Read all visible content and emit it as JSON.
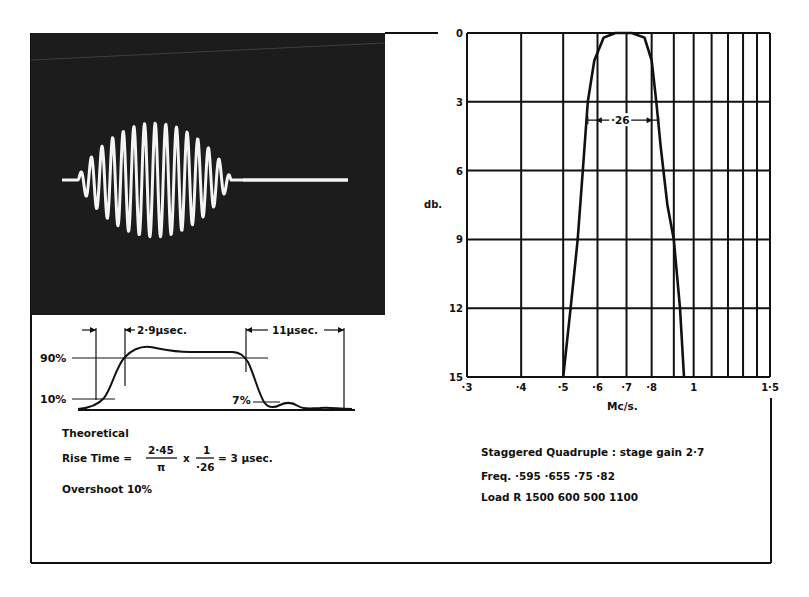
{
  "figure": {
    "photo": {
      "description": "oscilloscope trace of pulsed carrier burst",
      "background": "#1a1a1a",
      "trace_color": "#f4f4f4"
    },
    "pulse_diagram": {
      "label_90": "90%",
      "label_10": "10%",
      "label_7": "7%",
      "rise_label": "2·9µsec.",
      "decay_label": "11µsec."
    },
    "theory": {
      "heading": "Theoretical",
      "rise_prefix": "Rise Time =",
      "num1": "2·45",
      "den1": "π",
      "times": "x",
      "num2": "1",
      "den2": "·26",
      "result": "= 3 µsec.",
      "overshoot": "Overshoot  10%"
    },
    "notes": {
      "line1": "Staggered Quadruple : stage gain 2·7",
      "line2": "Freq.  ·595  ·655  ·75  ·82",
      "line3": "Load R 1500 600 500 1100"
    }
  },
  "chart_data": {
    "type": "line",
    "title": "",
    "xlabel": "Mc/s.",
    "ylabel": "db.",
    "x_scale": "log",
    "xlim": [
      0.3,
      1.5
    ],
    "ylim": [
      0,
      15
    ],
    "y_inverted": true,
    "grid": true,
    "x_ticks": [
      "·3",
      "·4",
      "·5",
      "·6",
      "·7",
      "·8",
      "1",
      "1·5"
    ],
    "x_grid_values": [
      0.3,
      0.4,
      0.5,
      0.6,
      0.7,
      0.8,
      0.9,
      1.0,
      1.1,
      1.2,
      1.3,
      1.4,
      1.5
    ],
    "y_ticks": [
      "0",
      "3",
      "6",
      "9",
      "12",
      "15"
    ],
    "y_tick_values": [
      0,
      3,
      6,
      9,
      12,
      15
    ],
    "annotations": [
      {
        "text": "·26",
        "type": "bandwidth-arrow",
        "x_from": 0.57,
        "x_to": 0.83,
        "y": 3.8
      }
    ],
    "series": [
      {
        "name": "Response",
        "x": [
          0.5,
          0.52,
          0.54,
          0.555,
          0.57,
          0.59,
          0.62,
          0.66,
          0.72,
          0.77,
          0.8,
          0.82,
          0.84,
          0.87,
          0.9,
          0.93,
          0.95
        ],
        "y": [
          15,
          12,
          9,
          6,
          3,
          1.2,
          0.2,
          0,
          0,
          0.2,
          1.2,
          3,
          5,
          7.5,
          9,
          12,
          15
        ]
      }
    ]
  }
}
